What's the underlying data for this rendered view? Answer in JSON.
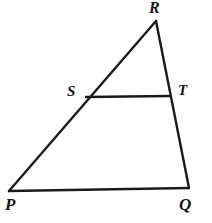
{
  "figure": {
    "kind": "geometry-diagram",
    "shape": "triangle-with-transversal",
    "background_color": "#ffffff",
    "stroke_color": "#1a1a1a",
    "stroke_width": 2.4,
    "canvas": {
      "width": 212,
      "height": 223
    },
    "labels": {
      "R": "R",
      "S": "S",
      "T": "T",
      "P": "P",
      "Q": "Q"
    },
    "points": {
      "P": {
        "x": 9,
        "y": 191
      },
      "Q": {
        "x": 189,
        "y": 188
      },
      "R": {
        "x": 156,
        "y": 21
      },
      "S": {
        "x": 86,
        "y": 97
      },
      "T": {
        "x": 170,
        "y": 96
      }
    },
    "segments": [
      {
        "name": "PR",
        "from": "P",
        "to": "R"
      },
      {
        "name": "RQ",
        "from": "R",
        "to": "Q"
      },
      {
        "name": "PQ",
        "from": "P",
        "to": "Q"
      },
      {
        "name": "ST",
        "from": "S",
        "to": "T"
      }
    ]
  }
}
